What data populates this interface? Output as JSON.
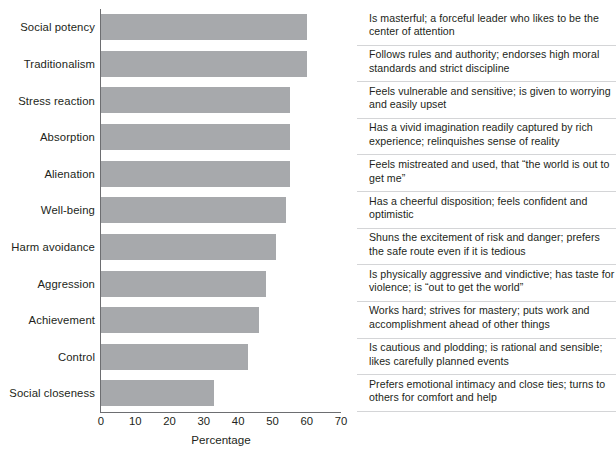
{
  "chart_data": {
    "type": "bar",
    "orientation": "horizontal",
    "title": "",
    "xlabel": "Percentage",
    "ylabel": "",
    "xlim": [
      0,
      70
    ],
    "xticks": [
      0,
      10,
      20,
      30,
      40,
      50,
      60,
      70
    ],
    "grid": false,
    "legend": null,
    "bar_color": "#a7a9ac",
    "axis_color": "#6d6e71",
    "text_color": "#231f20",
    "separator_color": "#d4d5d7",
    "categories": [
      "Social potency",
      "Traditionalism",
      "Stress reaction",
      "Absorption",
      "Alienation",
      "Well-being",
      "Harm avoidance",
      "Aggression",
      "Achievement",
      "Control",
      "Social closeness"
    ],
    "values": [
      60,
      60,
      55,
      55,
      55,
      54,
      51,
      48,
      46,
      43,
      33
    ],
    "annotations": [
      "Is masterful; a forceful leader who likes to be the center of attention",
      "Follows rules and authority; endorses high moral standards and strict discipline",
      "Feels vulnerable and sensitive; is given to worrying and easily upset",
      "Has a vivid imagination readily captured by rich experience; relinquishes sense of reality",
      "Feels mistreated and used, that “the world is out to get me”",
      "Has a cheerful disposition; feels confident and optimistic",
      "Shuns the excitement of risk and danger; prefers the safe route even if it is tedious",
      "Is physically aggressive and vindictive; has taste for violence; is “out to get the world”",
      "Works hard; strives for mastery; puts work and accomplishment ahead of other things",
      "Is cautious and plodding; is rational and sensible; likes carefully planned events",
      "Prefers emotional intimacy and close ties; turns to others for comfort and help"
    ]
  },
  "rows": [
    {
      "label": "Social potency",
      "value": 60,
      "description": "Is masterful; a forceful leader who likes to be the center of attention"
    },
    {
      "label": "Traditionalism",
      "value": 60,
      "description": "Follows rules and authority; endorses high moral standards and strict discipline"
    },
    {
      "label": "Stress reaction",
      "value": 55,
      "description": "Feels vulnerable and sensitive; is given to worrying and easily upset"
    },
    {
      "label": "Absorption",
      "value": 55,
      "description": "Has a vivid imagination readily captured by rich experience; relinquishes sense of reality"
    },
    {
      "label": "Alienation",
      "value": 55,
      "description": "Feels mistreated and used, that “the world is out to get me”"
    },
    {
      "label": "Well-being",
      "value": 54,
      "description": "Has a cheerful disposition; feels confident and optimistic"
    },
    {
      "label": "Harm avoidance",
      "value": 51,
      "description": "Shuns the excitement of risk and danger; prefers the safe route even if it is tedious"
    },
    {
      "label": "Aggression",
      "value": 48,
      "description": "Is physically aggressive and vindictive; has taste for violence; is “out to get the world”"
    },
    {
      "label": "Achievement",
      "value": 46,
      "description": "Works hard; strives for mastery; puts work and accomplishment ahead of other things"
    },
    {
      "label": "Control",
      "value": 43,
      "description": "Is cautious and plodding; is rational and sensible; likes carefully planned events"
    },
    {
      "label": "Social closeness",
      "value": 33,
      "description": "Prefers emotional intimacy and close ties; turns to others for comfort and help"
    }
  ],
  "axis": {
    "tick_labels": [
      "0",
      "10",
      "20",
      "30",
      "40",
      "50",
      "60",
      "70"
    ],
    "tick_values": [
      0,
      10,
      20,
      30,
      40,
      50,
      60,
      70
    ],
    "title": "Percentage"
  }
}
